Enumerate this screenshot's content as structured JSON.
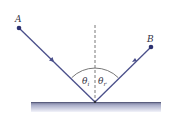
{
  "diagram": {
    "points": [
      {
        "label": "A",
        "x": 19,
        "y": 28
      },
      {
        "label": "B",
        "x": 151,
        "y": 47
      }
    ],
    "reflection_point": {
      "x": 95,
      "y": 102
    },
    "angles": [
      {
        "symbol": "θ",
        "sub": "i",
        "name": "angle of incidence"
      },
      {
        "symbol": "θ",
        "sub": "r",
        "name": "angle of reflection"
      }
    ],
    "colors": {
      "ray": "#4a4f8a",
      "point": "#2c3170",
      "normal": "#555555",
      "surface_top": "#6b6f8e",
      "surface_bottom": "#eef0f8"
    }
  }
}
